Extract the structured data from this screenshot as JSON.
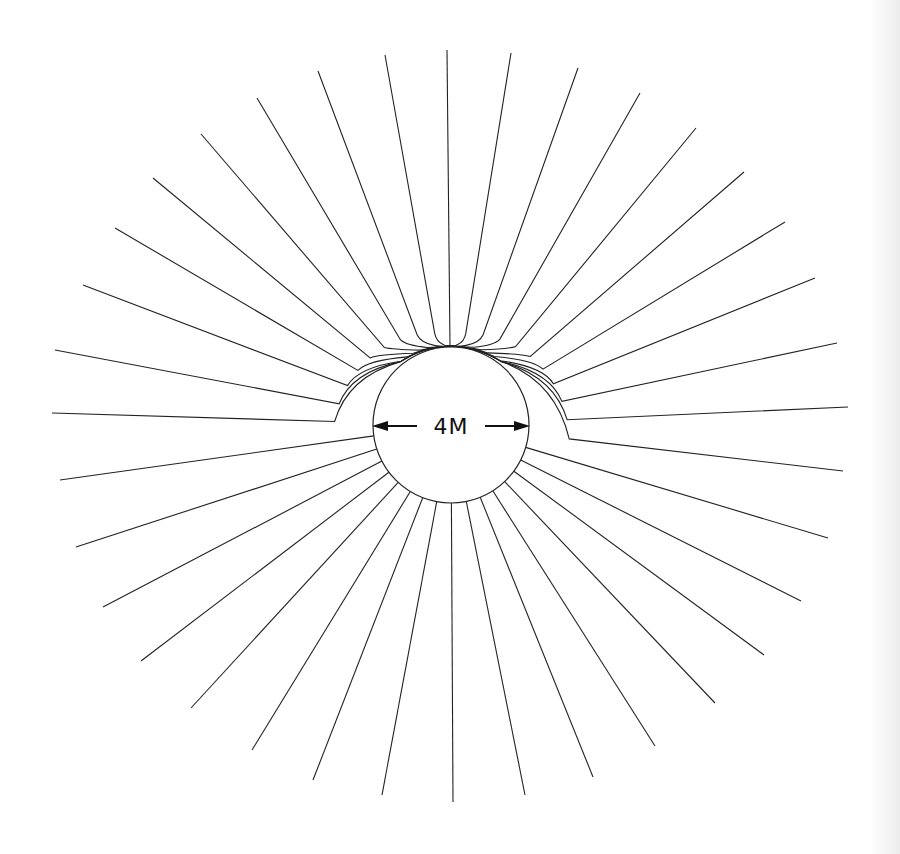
{
  "diagram": {
    "label": "4M",
    "colors": {
      "background": "#ffffff",
      "line": "#222222"
    },
    "circle": {
      "cx": 451,
      "cy": 425,
      "r": 78
    },
    "convergence_point": {
      "x": 450,
      "y": 346
    },
    "arrows": {
      "left": {
        "from_x": 417,
        "to_x": 372,
        "y": 426
      },
      "right": {
        "from_x": 485,
        "to_x": 530,
        "y": 426
      }
    },
    "ray_endpoints": [
      [
        447,
        50
      ],
      [
        511,
        53
      ],
      [
        578,
        68
      ],
      [
        640,
        93
      ],
      [
        696,
        128
      ],
      [
        744,
        172
      ],
      [
        785,
        222
      ],
      [
        815,
        278
      ],
      [
        837,
        343
      ],
      [
        848,
        407
      ],
      [
        843,
        471
      ],
      [
        828,
        538
      ],
      [
        801,
        601
      ],
      [
        764,
        655
      ],
      [
        715,
        703
      ],
      [
        655,
        746
      ],
      [
        593,
        777
      ],
      [
        525,
        795
      ],
      [
        453,
        802
      ],
      [
        382,
        795
      ],
      [
        313,
        780
      ],
      [
        252,
        750
      ],
      [
        191,
        708
      ],
      [
        141,
        661
      ],
      [
        103,
        607
      ],
      [
        76,
        547
      ],
      [
        60,
        480
      ],
      [
        52,
        413
      ],
      [
        55,
        350
      ],
      [
        83,
        285
      ],
      [
        115,
        228
      ],
      [
        153,
        178
      ],
      [
        201,
        134
      ],
      [
        257,
        98
      ],
      [
        318,
        71
      ],
      [
        385,
        55
      ]
    ],
    "ray_count": 36,
    "wrap_threshold_deg": 8
  }
}
